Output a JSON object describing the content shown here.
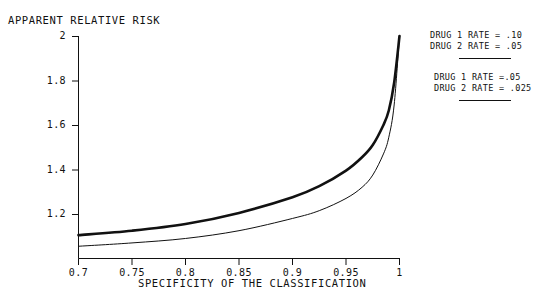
{
  "chart_data": {
    "type": "line",
    "title": "APPARENT RELATIVE RISK",
    "subtitle": "",
    "xlabel": "SPECIFICITY OF THE CLASSIFICATION",
    "ylabel": "APPARENT RELATIVE RISK",
    "xlim": [
      0.7,
      1.0
    ],
    "ylim": [
      1.0,
      2.0
    ],
    "xticks": [
      "0.7",
      "0.75",
      "0.8",
      "0.85",
      "0.9",
      "0.95",
      "1"
    ],
    "xtick_values": [
      0.7,
      0.75,
      0.8,
      0.85,
      0.9,
      0.95,
      1.0
    ],
    "yticks": [
      "1.2",
      "1.4",
      "1.6",
      "1.8",
      "2"
    ],
    "ytick_values": [
      1.2,
      1.4,
      1.6,
      1.8,
      2.0
    ],
    "grid": false,
    "legend_position": "top-right",
    "x": [
      0.7,
      0.75,
      0.8,
      0.85,
      0.9,
      0.925,
      0.95,
      0.965,
      0.975,
      0.985,
      0.99,
      0.995,
      1.0
    ],
    "series": [
      {
        "name": "DRUG 1 RATE = .10 / DRUG 2 RATE = .05",
        "linewidth": "thick",
        "color": "#111111",
        "values": [
          1.105,
          1.125,
          1.155,
          1.205,
          1.275,
          1.325,
          1.395,
          1.455,
          1.51,
          1.6,
          1.665,
          1.79,
          2.0
        ]
      },
      {
        "name": "DRUG 1 RATE =.05 / DRUG 2 RATE = .025",
        "linewidth": "thin",
        "color": "#111111",
        "values": [
          1.055,
          1.07,
          1.09,
          1.125,
          1.18,
          1.215,
          1.27,
          1.32,
          1.375,
          1.47,
          1.545,
          1.69,
          2.0
        ]
      }
    ]
  },
  "legend": {
    "entry_1": {
      "line_1": "DRUG 1 RATE =  .10",
      "line_2": "DRUG 2 RATE =  .05"
    },
    "entry_2": {
      "line_1": "DRUG 1 RATE =.05",
      "line_2": "DRUG 2 RATE =  .025"
    }
  }
}
